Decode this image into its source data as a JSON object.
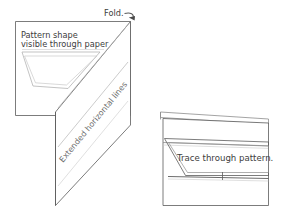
{
  "figure": {
    "background_color": "#ffffff",
    "ink_color": "#5a5a5a",
    "ghost_ink_color": "#b4b4b4",
    "width": 283,
    "height": 213
  },
  "labels": {
    "fold": "Fold.",
    "pattern_shape_line1": "Pattern shape",
    "pattern_shape_line2": "visible through paper",
    "extended_horizontal_lines": "Extended horizontal lines",
    "trace_through_pattern": "Trace through pattern."
  },
  "panels": [
    {
      "id": "left-panel",
      "name": "open-folded-paper",
      "caption_labels": [
        "Pattern shape",
        "visible through paper",
        "Extended horizontal lines",
        "Fold."
      ]
    },
    {
      "id": "right-panel",
      "name": "closed-folded-paper",
      "caption_labels": [
        "Trace through pattern."
      ]
    }
  ],
  "annotations": {
    "fold_arrow": "curved-arrow-icon",
    "fold_arrow_direction": "right-down"
  }
}
